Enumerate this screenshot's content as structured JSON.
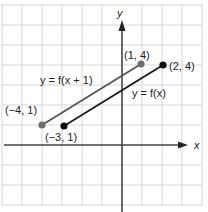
{
  "graph": {
    "origin_px": [
      122,
      145
    ],
    "unit_px": 20,
    "grid_x_px": [
      2,
      22,
      42,
      62,
      82,
      102,
      142,
      162,
      182,
      202
    ],
    "grid_y_px": [
      5,
      25,
      45,
      65,
      85,
      105,
      125,
      165,
      185,
      205
    ],
    "colors": {
      "grid": "#d6d6d6",
      "axis": "#444444",
      "line_fx": "#1a1a1a",
      "line_shift": "#555555",
      "dot_shift": "#6e6e6e"
    },
    "axis_labels": {
      "x": "x",
      "y": "y"
    },
    "segments": [
      {
        "name": "f-of-x",
        "label": "y = f(x)",
        "start": {
          "label": "(−3,  1)"
        },
        "end": {
          "label": "(2,  4)"
        }
      },
      {
        "name": "f-of-x-plus-1",
        "label": "y = f(x + 1)",
        "start": {
          "label": "(−4,  1)"
        },
        "end": {
          "label": "(1,  4)"
        }
      }
    ]
  }
}
